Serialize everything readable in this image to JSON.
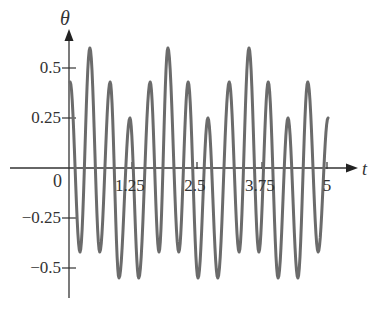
{
  "chart_data": {
    "type": "line",
    "title": "",
    "xlabel": "t",
    "ylabel": "θ",
    "xlim": [
      0,
      5
    ],
    "ylim": [
      -0.6,
      0.65
    ],
    "x_ticks": [
      1.25,
      2.5,
      3.75,
      5
    ],
    "x_tick_labels": [
      "1.25",
      "2.5",
      "3.75",
      "5"
    ],
    "y_ticks": [
      0.5,
      0.25,
      -0.25,
      -0.5
    ],
    "y_tick_labels": [
      "0.5",
      "0.25",
      "−0.25",
      "−0.5"
    ],
    "origin_label": "0",
    "grid": false,
    "legend": null,
    "series": [
      {
        "name": "θ(t)",
        "color": "#6b6b6b",
        "extrema": [
          [
            0.06,
            0.43
          ],
          [
            0.25,
            -0.42
          ],
          [
            0.44,
            0.6
          ],
          [
            0.63,
            -0.42
          ],
          [
            0.83,
            0.43
          ],
          [
            1.0,
            -0.55
          ],
          [
            1.21,
            0.25
          ],
          [
            1.38,
            -0.55
          ],
          [
            1.6,
            0.43
          ],
          [
            1.77,
            -0.42
          ],
          [
            1.94,
            0.6
          ],
          [
            2.15,
            -0.42
          ],
          [
            2.33,
            0.43
          ],
          [
            2.52,
            -0.55
          ],
          [
            2.71,
            0.25
          ],
          [
            2.9,
            -0.55
          ],
          [
            3.12,
            0.43
          ],
          [
            3.31,
            -0.42
          ],
          [
            3.5,
            0.6
          ],
          [
            3.69,
            -0.42
          ],
          [
            3.87,
            0.43
          ],
          [
            4.06,
            -0.55
          ],
          [
            4.25,
            0.25
          ],
          [
            4.44,
            -0.55
          ],
          [
            4.63,
            0.43
          ],
          [
            4.83,
            -0.42
          ],
          [
            5.02,
            0.25
          ]
        ]
      }
    ]
  },
  "axes": {
    "x_label": "t",
    "y_label": "θ",
    "origin": "0"
  }
}
